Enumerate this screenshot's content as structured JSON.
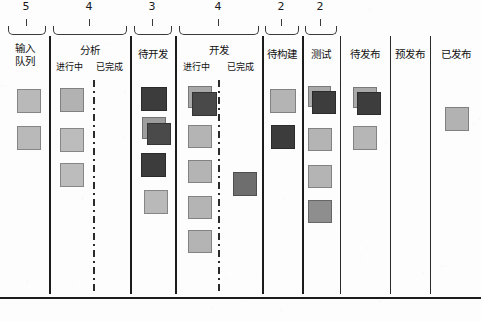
{
  "board": {
    "title": "Kanban Board",
    "width": 481,
    "height": 321,
    "colors": {
      "card_light": "#b9b9b9",
      "card_mid": "#9a9a9a",
      "card_dark": "#3a3a3a",
      "card_dark2": "#4a4a4a",
      "line": "#1c1c1c",
      "background": "#fdfdfd"
    }
  },
  "wip_limits": [
    {
      "value": "5",
      "x": 26,
      "brace_left": 8,
      "brace_right": 46
    },
    {
      "value": "4",
      "x": 89,
      "brace_left": 53,
      "brace_right": 127
    },
    {
      "value": "3",
      "x": 152,
      "brace_left": 134,
      "brace_right": 172
    },
    {
      "value": "4",
      "x": 218,
      "brace_left": 179,
      "brace_right": 259
    },
    {
      "value": "2",
      "x": 281,
      "brace_left": 265,
      "brace_right": 299
    },
    {
      "value": "2",
      "x": 320,
      "brace_left": 305,
      "brace_right": 337
    }
  ],
  "columns": [
    {
      "id": "input-queue",
      "label": "输入\n队列",
      "label_lines": [
        "输入",
        "队列"
      ],
      "left": 0,
      "right": 49,
      "wip": "5",
      "subcolumns": []
    },
    {
      "id": "analysis",
      "label": "分析",
      "left": 49,
      "right": 130,
      "wip": "4",
      "subcolumns": [
        {
          "id": "analysis-doing",
          "label": "进行中"
        },
        {
          "id": "analysis-done",
          "label": "已完成"
        }
      ]
    },
    {
      "id": "ready-for-dev",
      "label": "待开发",
      "left": 130,
      "right": 175,
      "wip": "3",
      "subcolumns": []
    },
    {
      "id": "development",
      "label": "开发",
      "left": 175,
      "right": 262,
      "wip": "4",
      "subcolumns": [
        {
          "id": "development-doing",
          "label": "进行中"
        },
        {
          "id": "development-done",
          "label": "已完成"
        }
      ]
    },
    {
      "id": "ready-for-build",
      "label": "待构建",
      "left": 262,
      "right": 302,
      "wip": "2",
      "subcolumns": []
    },
    {
      "id": "test",
      "label": "测试",
      "left": 302,
      "right": 340,
      "wip": "2",
      "subcolumns": []
    },
    {
      "id": "ready-to-release",
      "label": "待发布",
      "left": 340,
      "right": 390,
      "wip": "",
      "subcolumns": []
    },
    {
      "id": "pre-release",
      "label": "预发布",
      "left": 390,
      "right": 430,
      "wip": "",
      "subcolumns": []
    },
    {
      "id": "released",
      "label": "已发布",
      "left": 430,
      "right": 481,
      "wip": "",
      "subcolumns": []
    }
  ],
  "dividers": [
    {
      "x": 49,
      "weight": "thick"
    },
    {
      "x": 130,
      "weight": "thick"
    },
    {
      "x": 175,
      "weight": "thick"
    },
    {
      "x": 262,
      "weight": "thick"
    },
    {
      "x": 302,
      "weight": "thick"
    },
    {
      "x": 340,
      "weight": "thin"
    },
    {
      "x": 390,
      "weight": "thin"
    },
    {
      "x": 430,
      "weight": "thin"
    }
  ],
  "dashdot_separators": [
    {
      "x": 93
    },
    {
      "x": 218
    }
  ],
  "cards": [
    {
      "column": "input-queue",
      "x": 17,
      "y": 89,
      "w": 24,
      "h": 24,
      "color": "#b9b9b9"
    },
    {
      "column": "input-queue",
      "x": 17,
      "y": 126,
      "w": 24,
      "h": 24,
      "color": "#b9b9b9"
    },
    {
      "column": "analysis-doing",
      "x": 60,
      "y": 88,
      "w": 24,
      "h": 24,
      "color": "#b2b2b2"
    },
    {
      "column": "analysis-doing",
      "x": 60,
      "y": 128,
      "w": 24,
      "h": 24,
      "color": "#bcbcbc"
    },
    {
      "column": "analysis-doing",
      "x": 60,
      "y": 163,
      "w": 24,
      "h": 24,
      "color": "#bcbcbc"
    },
    {
      "column": "ready-for-dev",
      "x": 141,
      "y": 87,
      "w": 26,
      "h": 24,
      "color": "#3c3c3c"
    },
    {
      "column": "ready-for-dev",
      "x": 142,
      "y": 117,
      "w": 24,
      "h": 22,
      "color": "#9d9d9d"
    },
    {
      "column": "ready-for-dev",
      "x": 147,
      "y": 123,
      "w": 24,
      "h": 22,
      "color": "#4a4a4a"
    },
    {
      "column": "ready-for-dev",
      "x": 141,
      "y": 153,
      "w": 25,
      "h": 24,
      "color": "#3c3c3c"
    },
    {
      "column": "ready-for-dev",
      "x": 144,
      "y": 190,
      "w": 24,
      "h": 24,
      "color": "#b9b9b9"
    },
    {
      "column": "development-doing",
      "x": 188,
      "y": 86,
      "w": 24,
      "h": 22,
      "color": "#a8a8a8"
    },
    {
      "column": "development-doing",
      "x": 192,
      "y": 92,
      "w": 25,
      "h": 24,
      "color": "#494949"
    },
    {
      "column": "development-doing",
      "x": 188,
      "y": 125,
      "w": 24,
      "h": 23,
      "color": "#b4b4b4"
    },
    {
      "column": "development-doing",
      "x": 188,
      "y": 160,
      "w": 24,
      "h": 23,
      "color": "#b4b4b4"
    },
    {
      "column": "development-doing",
      "x": 188,
      "y": 196,
      "w": 24,
      "h": 23,
      "color": "#b4b4b4"
    },
    {
      "column": "development-doing",
      "x": 188,
      "y": 230,
      "w": 24,
      "h": 23,
      "color": "#b4b4b4"
    },
    {
      "column": "development-done",
      "x": 233,
      "y": 172,
      "w": 24,
      "h": 24,
      "color": "#6e6e6e"
    },
    {
      "column": "ready-for-build",
      "x": 270,
      "y": 89,
      "w": 26,
      "h": 24,
      "color": "#b4b4b4"
    },
    {
      "column": "ready-for-build",
      "x": 271,
      "y": 125,
      "w": 24,
      "h": 24,
      "color": "#3c3c3c"
    },
    {
      "column": "test",
      "x": 308,
      "y": 86,
      "w": 23,
      "h": 21,
      "color": "#a9a9a9"
    },
    {
      "column": "test",
      "x": 312,
      "y": 91,
      "w": 24,
      "h": 23,
      "color": "#3d3d3d"
    },
    {
      "column": "test",
      "x": 308,
      "y": 128,
      "w": 24,
      "h": 23,
      "color": "#b4b4b4"
    },
    {
      "column": "test",
      "x": 308,
      "y": 165,
      "w": 24,
      "h": 23,
      "color": "#b4b4b4"
    },
    {
      "column": "test",
      "x": 308,
      "y": 200,
      "w": 24,
      "h": 23,
      "color": "#8e8e8e"
    },
    {
      "column": "ready-to-release",
      "x": 353,
      "y": 87,
      "w": 24,
      "h": 21,
      "color": "#a9a9a9"
    },
    {
      "column": "ready-to-release",
      "x": 357,
      "y": 92,
      "w": 24,
      "h": 23,
      "color": "#3d3d3d"
    },
    {
      "column": "ready-to-release",
      "x": 353,
      "y": 126,
      "w": 24,
      "h": 24,
      "color": "#b6b6b6"
    },
    {
      "column": "released",
      "x": 445,
      "y": 107,
      "w": 24,
      "h": 24,
      "color": "#b2b2b2"
    }
  ],
  "bottom_rule": {
    "y": 297
  }
}
